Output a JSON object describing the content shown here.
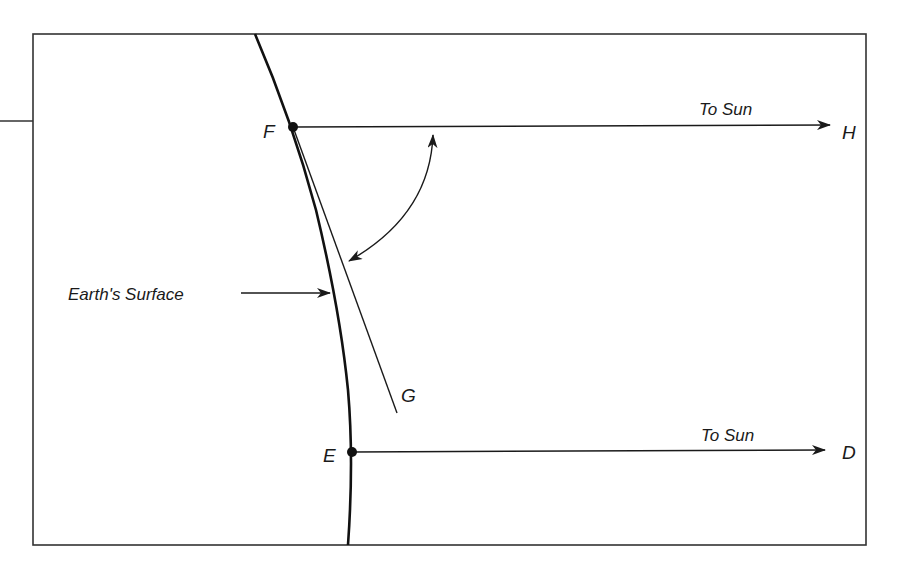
{
  "diagram": {
    "labels": {
      "earth_surface": "Earth's Surface",
      "ray_top": "To Sun",
      "ray_bottom": "To Sun",
      "point_F": "F",
      "point_H": "H",
      "point_G": "G",
      "point_E": "E",
      "point_D": "D"
    },
    "colors": {
      "stroke": "#1a1a1a",
      "frame": "#333333",
      "background": "#ffffff"
    },
    "elements": [
      {
        "id": "earth-surface-curve",
        "type": "curve",
        "from": "top of frame",
        "through": [
          "F",
          "E"
        ],
        "to": "bottom of frame"
      },
      {
        "id": "ray-FH",
        "type": "arrow",
        "from": "F",
        "to": "H",
        "label": "To Sun"
      },
      {
        "id": "ray-ED",
        "type": "arrow",
        "from": "E",
        "to": "D",
        "label": "To Sun"
      },
      {
        "id": "line-FG",
        "type": "line",
        "from": "F",
        "to": "G",
        "note": "tangent-like line from F"
      },
      {
        "id": "angle-arrow",
        "type": "double-headed curved arrow",
        "between": [
          "ray FH",
          "line FG"
        ]
      },
      {
        "id": "surface-pointer",
        "type": "arrow",
        "label": "Earth's Surface",
        "points_to": "earth-surface-curve"
      }
    ]
  }
}
